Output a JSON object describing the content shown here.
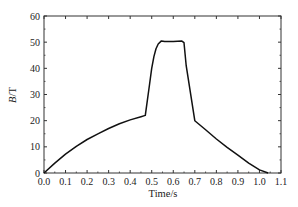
{
  "chart_data": {
    "type": "line",
    "title": "",
    "xlabel": "Time/s",
    "ylabel": "B/T",
    "ylabel_italic_part": "B",
    "ylabel_rest": "/T",
    "xlim": [
      0.0,
      1.1
    ],
    "ylim": [
      0,
      60
    ],
    "grid": false,
    "legend": null,
    "x_ticks": [
      "0.0",
      "0.1",
      "0.2",
      "0.3",
      "0.4",
      "0.5",
      "0.6",
      "0.7",
      "0.8",
      "0.9",
      "1.0",
      "1.1"
    ],
    "y_ticks": [
      "0",
      "10",
      "20",
      "30",
      "40",
      "50",
      "60"
    ],
    "series": [
      {
        "name": "B",
        "color": "#111111",
        "x": [
          0.0,
          0.05,
          0.1,
          0.15,
          0.2,
          0.25,
          0.3,
          0.35,
          0.4,
          0.45,
          0.47,
          0.49,
          0.5,
          0.51,
          0.52,
          0.53,
          0.545,
          0.56,
          0.6,
          0.64,
          0.65,
          0.66,
          0.7,
          0.75,
          0.8,
          0.85,
          0.9,
          0.95,
          1.0,
          1.04
        ],
        "y": [
          0.0,
          3.8,
          7.2,
          10.2,
          12.8,
          15.0,
          17.0,
          18.8,
          20.3,
          21.5,
          22.0,
          34.0,
          40.0,
          44.5,
          47.5,
          49.3,
          50.5,
          50.2,
          50.3,
          50.4,
          49.8,
          41.0,
          20.0,
          16.5,
          13.0,
          9.8,
          6.8,
          3.8,
          1.2,
          0.0
        ]
      }
    ]
  }
}
